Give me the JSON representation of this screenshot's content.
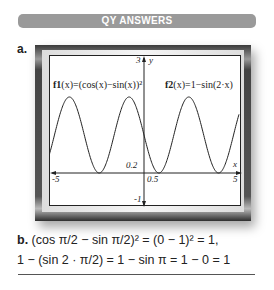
{
  "header": {
    "title": "QY ANSWERS",
    "color": "#9a9a9a"
  },
  "part_a": {
    "label": "a.",
    "graph": {
      "f1_name": "f1",
      "f1_rest": "(x)=(cos(x)−sin(x))²",
      "f2_name": "f2",
      "f2_rest": "(x)=1−sin(2·x)",
      "y_axis_label": "y",
      "x_axis_label": "x",
      "ticks": {
        "ymax": "3",
        "ymin": "-1",
        "xmin": "-5",
        "xmax": "5",
        "yscale": "0.2",
        "xscale": "0.5"
      }
    }
  },
  "part_b": {
    "label": "b.",
    "line1": "(cos π/2 − sin π/2)² = (0 − 1)² = 1,",
    "line2": "1 − (sin 2 · π/2) = 1 − sin π = 1 − 0 = 1"
  },
  "chart_data": {
    "type": "line",
    "title": "",
    "xlabel": "x",
    "ylabel": "y",
    "xlim": [
      -5,
      5
    ],
    "ylim": [
      -1,
      3
    ],
    "grid": false,
    "series": [
      {
        "name": "f1(x)=(cos(x)-sin(x))^2",
        "expression": "(cos(x)-sin(x))^2"
      },
      {
        "name": "f2(x)=1-sin(2x)",
        "expression": "1-sin(2x)"
      }
    ],
    "annotations": [
      "0.2",
      "0.5",
      "3",
      "-1",
      "-5",
      "5"
    ]
  }
}
